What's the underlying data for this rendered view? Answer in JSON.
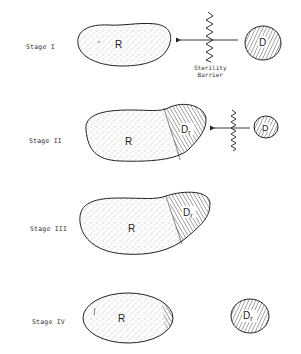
{
  "figure": {
    "stages": [
      {
        "label": "Stage I",
        "recipient_label": "R",
        "donor_label": "D",
        "barrier_caption_line1": "Sterility",
        "barrier_caption_line2": "Barrier"
      },
      {
        "label": "Stage  II",
        "recipient_label": "R",
        "donor_region_label": "Dr",
        "donor_label": "D"
      },
      {
        "label": "Stage III",
        "recipient_label": "R",
        "donor_region_label": "Dr"
      },
      {
        "label": "Stage IV",
        "recipient_label": "R",
        "donor_region_label": "Dr"
      }
    ],
    "colors": {
      "outline": "#222222",
      "stipple": "#555555",
      "hatch": "#333333",
      "background": "#ffffff"
    }
  }
}
